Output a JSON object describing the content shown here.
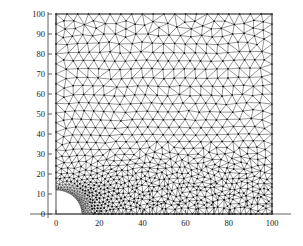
{
  "figure": {
    "kind": "finite-element-mesh-plot",
    "background_color": "#ffffff",
    "mesh_line_color": "#2b2b2b",
    "node_color": "#000000",
    "axis_color": "#333333",
    "tick_label_color": "#1a1a1a"
  },
  "axes": {
    "x": {
      "label": "",
      "min": 0,
      "max": 100,
      "tick_values": [
        0,
        20,
        40,
        60,
        80,
        100
      ],
      "tick_labels": [
        "0",
        "20",
        "40",
        "60",
        "80",
        "100"
      ],
      "axis_extends_beyond_data": true
    },
    "y": {
      "label": "",
      "min": 0,
      "max": 100,
      "tick_values": [
        0,
        10,
        20,
        30,
        40,
        50,
        60,
        70,
        80,
        90,
        100
      ],
      "tick_labels": [
        "0",
        "10",
        "20",
        "30",
        "40",
        "50",
        "60",
        "70",
        "80",
        "90",
        "100"
      ],
      "axis_extends_beyond_data": true
    }
  },
  "chart_data": {
    "type": "mesh",
    "title": "",
    "xlabel": "",
    "ylabel": "",
    "xlim": [
      0,
      100
    ],
    "ylim": [
      0,
      100
    ],
    "grid": false,
    "legend": null,
    "categories": [
      "0",
      "20",
      "40",
      "60",
      "80",
      "100"
    ],
    "values": [
      0,
      20,
      40,
      60,
      80,
      100
    ],
    "domain": {
      "shape": "square-with-quarter-circular-hole",
      "square_corner_min": [
        0,
        0
      ],
      "square_corner_max": [
        100,
        100
      ],
      "hole_center": [
        0,
        0
      ],
      "hole_radius": 12,
      "hole_quadrant": "first"
    },
    "mesh": {
      "element_type": "triangle",
      "node_marker": "dot",
      "node_marker_size_px": 1.4,
      "edge_width_px": 0.5,
      "nominal_element_size_far": 5.0,
      "nominal_element_size_at_hole": 0.9,
      "grading_law": "size grows with distance from hole boundary",
      "approx_node_count": 1150,
      "approx_element_count": 2200,
      "boundary_nodes_on_hole": 46,
      "boundary_nodes_per_square_side": 21
    }
  },
  "plot_box": {
    "left_px": 56,
    "top_px": 14,
    "right_px": 272,
    "bottom_px": 214,
    "border_visible": true,
    "border_color": "#3a3a3a"
  }
}
